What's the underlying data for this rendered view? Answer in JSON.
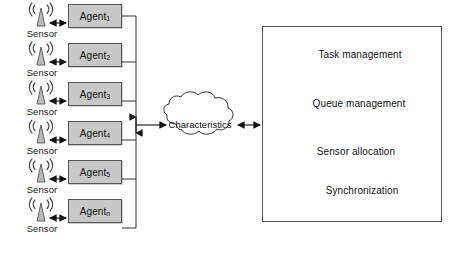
{
  "diagram": {
    "colors": {
      "agent_fill": "#c8c8c8",
      "block_light_top": "#d2d2d2",
      "block_light_face": "#c9c9c9",
      "block_light_side": "#a8a8a8",
      "block_dark_face": "#8e8e8e",
      "block_dark_side": "#6f6f6f",
      "stroke": "#555555",
      "panel_border": "#555555",
      "cloud_stroke": "#333333",
      "text": "#111111"
    },
    "agents": [
      {
        "name": "Agent",
        "subscript": "1",
        "sensor_label": "Sensor",
        "icon": "antenna-sensor-icon"
      },
      {
        "name": "Agent",
        "subscript": "2",
        "sensor_label": "Sensor",
        "icon": "antenna-sensor-icon"
      },
      {
        "name": "Agent",
        "subscript": "3",
        "sensor_label": "Sensor",
        "icon": "antenna-sensor-icon"
      },
      {
        "name": "Agent",
        "subscript": "4",
        "sensor_label": "Sensor",
        "icon": "antenna-sensor-icon"
      },
      {
        "name": "Agent",
        "subscript": "5",
        "sensor_label": "Sensor",
        "icon": "antenna-sensor-icon"
      },
      {
        "name": "Agent",
        "subscript": "n",
        "sensor_label": "Sensor",
        "icon": "antenna-sensor-icon"
      }
    ],
    "cloud": {
      "label": "Characteristics",
      "icon": "cloud-shape-icon"
    },
    "panel": {
      "blocks": [
        {
          "label": "Task management",
          "style": "light",
          "shape": "tapered-slab"
        },
        {
          "label": "Queue management",
          "style": "dark",
          "shape": "slab"
        },
        {
          "label": "Sensor allocation",
          "style": "light",
          "shape": "slab"
        },
        {
          "label": "Synchronization",
          "style": "light",
          "shape": "thick-slab"
        }
      ]
    },
    "connectors": [
      {
        "from": "sensor",
        "to": "agent",
        "type": "double-arrow"
      },
      {
        "from": "agent-bus",
        "to": "cloud",
        "type": "double-arrow"
      },
      {
        "from": "cloud",
        "to": "panel",
        "type": "double-arrow"
      }
    ]
  }
}
